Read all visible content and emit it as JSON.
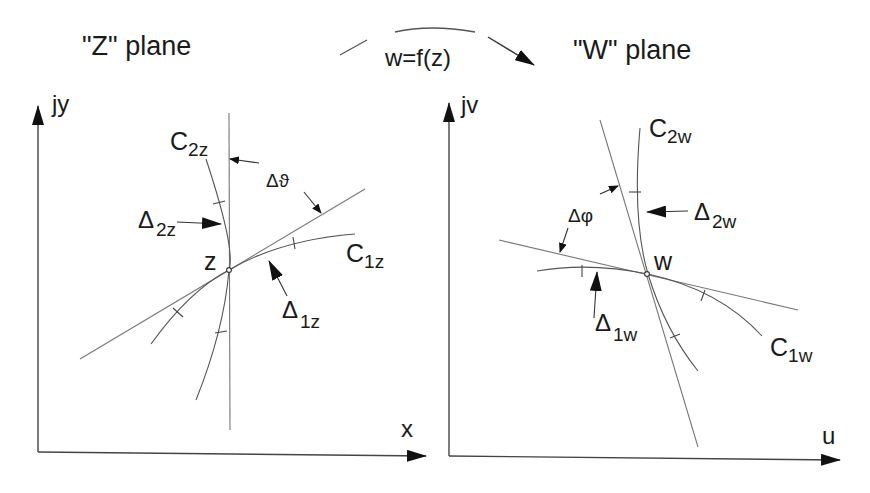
{
  "titles": {
    "z_plane": "\"Z\" plane",
    "w_plane": "\"W\" plane",
    "mapping": "w=f(z)"
  },
  "z_plane": {
    "y_axis_label": "jy",
    "x_axis_label": "x",
    "point_label": "z",
    "curve1": {
      "main": "C",
      "sub": "1z"
    },
    "curve2": {
      "main": "C",
      "sub": "2z"
    },
    "delta1": {
      "main": "Δ",
      "sub": "1z"
    },
    "delta2": {
      "main": "Δ",
      "sub": "2z"
    },
    "angle_label": "Δϑ"
  },
  "w_plane": {
    "y_axis_label": "jv",
    "x_axis_label": "u",
    "point_label": "w",
    "curve1": {
      "main": "C",
      "sub": "1w"
    },
    "curve2": {
      "main": "C",
      "sub": "2w"
    },
    "delta1": {
      "main": "Δ",
      "sub": "1w"
    },
    "delta2": {
      "main": "Δ",
      "sub": "2w"
    },
    "angle_label": "Δφ"
  }
}
